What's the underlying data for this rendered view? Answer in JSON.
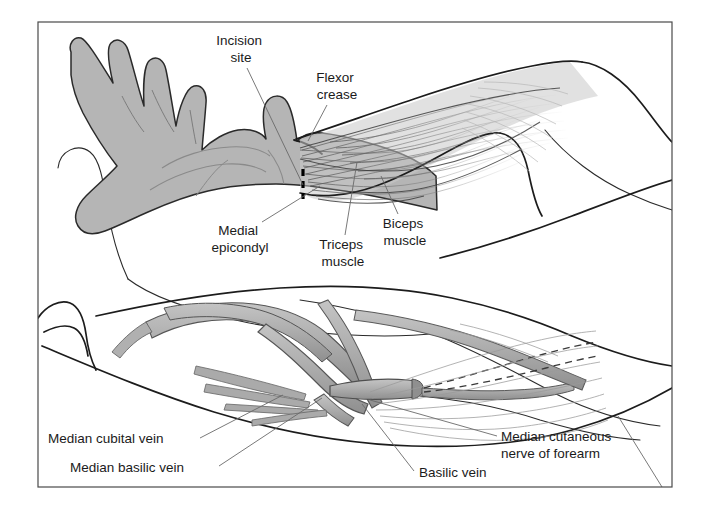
{
  "figure": {
    "frame": {
      "x": 38,
      "y": 22,
      "width": 634,
      "height": 465,
      "border_color": "#4a4a4a"
    },
    "palette": {
      "background": "#ffffff",
      "skin_fill": "#b5b5b5",
      "skin_fill_light": "#c9c9c9",
      "vein_fill": "#b0b0b0",
      "vein_fill_dark": "#9a9a9a",
      "outline": "#1c1c1c",
      "muscle_fiber": "#6e6e6e",
      "leader_line": "#6a6a6a",
      "label_text": "#1b1b1b",
      "incision_marker": "#000000",
      "nerve_dashed": "#3a3a3a"
    }
  },
  "panels": [
    {
      "id": "upper-panel",
      "name": "surface-anatomy-panel",
      "description": "Supinated forearm and hand with elbow flexor region and arm musculature"
    },
    {
      "id": "lower-panel",
      "name": "venous-anatomy-panel",
      "description": "Superficial veins of the cubital fossa with median cutaneous nerve of forearm"
    }
  ],
  "labels": [
    {
      "id": "incision-site",
      "text": "Incision site",
      "lines": [
        "Incision",
        "site"
      ],
      "align": "center",
      "x": 241,
      "y": 45,
      "line_height": 17,
      "panel": "upper-panel",
      "leader": [
        [
          247,
          68
        ],
        [
          303,
          185
        ]
      ]
    },
    {
      "id": "flexor-crease",
      "text": "Flexor crease",
      "lines": [
        "Flexor",
        "crease"
      ],
      "align": "center",
      "x": 337,
      "y": 82,
      "line_height": 17,
      "panel": "upper-panel",
      "leader": [
        [
          327,
          105
        ],
        [
          308,
          141
        ]
      ]
    },
    {
      "id": "medial-epicondyl",
      "text": "Medial epicondyl",
      "lines": [
        "Medial",
        "epicondyl"
      ],
      "align": "center",
      "x": 240,
      "y": 235,
      "line_height": 17,
      "panel": "upper-panel",
      "leader": [
        [
          262,
          222
        ],
        [
          320,
          186
        ]
      ]
    },
    {
      "id": "triceps-muscle",
      "text": "Triceps muscle",
      "lines": [
        "Triceps",
        "muscle"
      ],
      "align": "center",
      "x": 343,
      "y": 249,
      "line_height": 17,
      "panel": "upper-panel",
      "leader": [
        [
          345,
          235
        ],
        [
          357,
          162
        ]
      ]
    },
    {
      "id": "biceps-muscle",
      "text": "Biceps muscle",
      "lines": [
        "Biceps",
        "muscle"
      ],
      "align": "center",
      "x": 405,
      "y": 228,
      "line_height": 17,
      "panel": "upper-panel",
      "leader": [
        [
          398,
          214
        ],
        [
          381,
          176
        ]
      ]
    },
    {
      "id": "median-cubital-vein",
      "text": "Median cubital vein",
      "lines": [
        "Median cubital vein"
      ],
      "align": "start",
      "x": 48,
      "y": 443,
      "line_height": 17,
      "panel": "lower-panel",
      "leader": [
        [
          200,
          438
        ],
        [
          283,
          395
        ]
      ]
    },
    {
      "id": "median-basilic-vein",
      "text": "Median basilic vein",
      "lines": [
        "Median basilic vein"
      ],
      "align": "start",
      "x": 70,
      "y": 472,
      "line_height": 17,
      "panel": "lower-panel",
      "leader": [
        [
          219,
          466
        ],
        [
          322,
          398
        ]
      ]
    },
    {
      "id": "basilic-vein",
      "text": "Basilic vein",
      "lines": [
        "Basilic vein"
      ],
      "align": "start",
      "x": 419,
      "y": 477,
      "line_height": 17,
      "panel": "lower-panel",
      "leader": [
        [
          414,
          471
        ],
        [
          362,
          404
        ]
      ]
    },
    {
      "id": "median-cutaneous-nerve-of-forearm",
      "text": "Median cutaneous nerve of forearm",
      "lines": [
        "Median cutaneous",
        "nerve of forearm"
      ],
      "align": "start",
      "x": 501,
      "y": 441,
      "line_height": 17,
      "panel": "lower-panel",
      "leader": [
        [
          497,
          436
        ],
        [
          370,
          400
        ]
      ]
    }
  ],
  "markers": [
    {
      "id": "incision-marker",
      "name": "incision-dashed-line",
      "panel": "upper-panel",
      "style": "dashed-vertical",
      "color": "#000000",
      "x": 303,
      "y_top": 169,
      "y_bottom": 200,
      "dash_count": 3
    },
    {
      "id": "nerve-dashed-upper",
      "name": "nerve-dashed-line-upper",
      "panel": "lower-panel",
      "style": "dashed-curve",
      "color": "#3a3a3a"
    },
    {
      "id": "nerve-dashed-lower",
      "name": "nerve-dashed-line-lower",
      "panel": "lower-panel",
      "style": "dashed-curve",
      "color": "#3a3a3a"
    }
  ],
  "structures": [
    {
      "id": "hand",
      "name": "hand-supinated",
      "panel": "upper-panel"
    },
    {
      "id": "forearm",
      "name": "forearm",
      "panel": "upper-panel"
    },
    {
      "id": "biceps",
      "name": "biceps-muscle-belly",
      "panel": "upper-panel"
    },
    {
      "id": "triceps",
      "name": "triceps-muscle-belly",
      "panel": "upper-panel"
    },
    {
      "id": "vein-median-cubital",
      "name": "median-cubital-vein-vessel",
      "panel": "lower-panel"
    },
    {
      "id": "vein-median-basilic",
      "name": "median-basilic-vein-vessel",
      "panel": "lower-panel"
    },
    {
      "id": "vein-basilic",
      "name": "basilic-vein-vessel",
      "panel": "lower-panel"
    },
    {
      "id": "vein-cephalic",
      "name": "cephalic-vein-vessel",
      "panel": "lower-panel"
    }
  ]
}
